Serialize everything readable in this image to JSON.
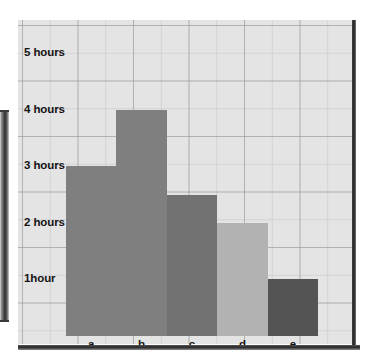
{
  "chart_data": {
    "type": "bar",
    "title": "",
    "xlabel": "",
    "ylabel": "",
    "categories": [
      "a",
      "b",
      "c",
      "d",
      "e"
    ],
    "values": [
      3,
      4,
      2.5,
      2,
      1
    ],
    "unit": "hours",
    "ylim": [
      0,
      5.5
    ],
    "ytick_values": [
      5,
      4,
      3,
      2,
      1
    ],
    "ytick_labels": [
      "5 hours",
      "4 hours",
      "3 hours",
      "2 hours",
      "1hour"
    ],
    "grid": true,
    "legend": null,
    "bar_colors": [
      "#7f7f7f",
      "#7f7f7f",
      "#727272",
      "#b2b2b2",
      "#545454"
    ],
    "background_color": "#e4e4e4",
    "gridline_color": "#969696",
    "text_color": "#141414"
  },
  "axis": {
    "y_labels": [
      {
        "text": "5 hours",
        "value": 5
      },
      {
        "text": "4 hours",
        "value": 4
      },
      {
        "text": "3 hours",
        "value": 3
      },
      {
        "text": "2 hours",
        "value": 2
      },
      {
        "text": "1hour",
        "value": 1
      }
    ],
    "x_labels": [
      "a",
      "b",
      "c",
      "d",
      "e"
    ]
  }
}
